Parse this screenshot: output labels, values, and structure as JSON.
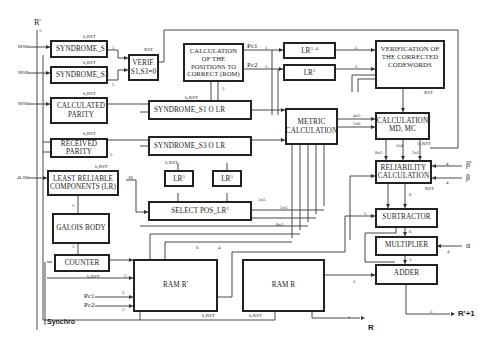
{
  "diagram": {
    "blocks": {
      "syndrome_s1": "SYNDROME_S1",
      "syndrome_s3": "SYNDROME_S3",
      "calculated_parity": "CALCULATED PARITY",
      "received_parity": "RECEIVED PARITY",
      "least_reliable": "LEAST RELIABLE COMPONENTS (LR)",
      "galois_body": "GALOIS BODY",
      "counter": "COUNTER",
      "verif": "VERIF. S1,S3=0",
      "calc_positions": "CALCULATION OF THE POSITIONS TO CORRECT (ROM)",
      "lr_top1": "LR",
      "lr_top1_sup": "3+4",
      "lr_top2": "LR",
      "lr_top2_sup": "3",
      "verification_codewords": "VERIFICATION OF THE CORRECTED CODEWORDS",
      "syndrome_s1_lr": "SYNDROME_S1 O LR",
      "syndrome_s3_lr": "SYNDROME_S3 O LR",
      "metric_calculation": "METRIC CALCULATION",
      "lr_mid1": "LR",
      "lr_mid1_sup": "3",
      "lr_mid2": "LR",
      "lr_mid2_sup": "3",
      "select_pos": "SELECT POS_LR",
      "select_pos_sup": "3",
      "calculation_md_mc": "CALCULATION MD, MC",
      "reliability_calculation": "RELIABILITY CALCULATION",
      "subtractor": "SUBTRACTOR",
      "multiplier": "MULTIPLIER",
      "adder": "ADDER",
      "ram_r_prime": "RAM R'",
      "ram_r": "RAM R"
    },
    "signals": {
      "r_prime_in": "R'",
      "msb1": "MSB",
      "msb2": "MSB",
      "msb3": "MSB",
      "lsb": "4LSB",
      "pc1_out": "Pc1",
      "pc2_out": "Pc2",
      "pc1_in": "Pc1",
      "pc2_in": "Pc2",
      "synchro": "Synchro",
      "r_out": "R",
      "r_next": "R'+1",
      "beta_prime": "β'",
      "beta": "β",
      "alpha": "α"
    },
    "bus_widths": {
      "w5": "5",
      "w36": "36",
      "w4": "4",
      "w6": "6",
      "w4x5": "4x5",
      "w5x6": "5x6",
      "w8x5": "8x5",
      "w2x6": "2x6",
      "w2x5": "2x5",
      "w5x5": "5x5",
      "w8x2": "8x2"
    },
    "control_labels": {
      "h_rst": "h,RST",
      "rst": "RST"
    }
  }
}
